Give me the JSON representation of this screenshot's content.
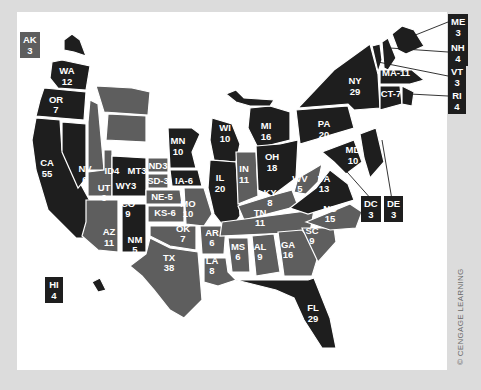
{
  "map": {
    "title": "",
    "legend_colors": {
      "dark": "#1e1e1e",
      "medium": "#5e5e5e",
      "background": "#ffffff",
      "frame": "#dcdcdc"
    },
    "states": {
      "WA": {
        "abbr": "WA",
        "votes": "12",
        "shade": "dark"
      },
      "OR": {
        "abbr": "OR",
        "votes": "7",
        "shade": "dark"
      },
      "CA": {
        "abbr": "CA",
        "votes": "55",
        "shade": "dark"
      },
      "NV": {
        "abbr": "NV",
        "votes": "6",
        "shade": "dark"
      },
      "ID": {
        "abbr": "ID4",
        "votes": "",
        "shade": "medium"
      },
      "MT": {
        "abbr": "MT3",
        "votes": "",
        "shade": "medium"
      },
      "WY": {
        "abbr": "WY3",
        "votes": "",
        "shade": "medium"
      },
      "UT": {
        "abbr": "UT",
        "votes": "6",
        "shade": "medium"
      },
      "CO": {
        "abbr": "CO",
        "votes": "9",
        "shade": "dark"
      },
      "AZ": {
        "abbr": "AZ",
        "votes": "11",
        "shade": "medium"
      },
      "NM": {
        "abbr": "NM",
        "votes": "5",
        "shade": "dark"
      },
      "ND": {
        "abbr": "ND3",
        "votes": "",
        "shade": "medium"
      },
      "SD": {
        "abbr": "SD-3",
        "votes": "",
        "shade": "medium"
      },
      "NE": {
        "abbr": "NE-5",
        "votes": "",
        "shade": "medium"
      },
      "KS": {
        "abbr": "KS-6",
        "votes": "",
        "shade": "medium"
      },
      "OK": {
        "abbr": "OK",
        "votes": "7",
        "shade": "medium"
      },
      "TX": {
        "abbr": "TX",
        "votes": "38",
        "shade": "medium"
      },
      "MN": {
        "abbr": "MN",
        "votes": "10",
        "shade": "dark"
      },
      "IA": {
        "abbr": "IA-6",
        "votes": "",
        "shade": "dark"
      },
      "MO": {
        "abbr": "MO",
        "votes": "10",
        "shade": "medium"
      },
      "AR": {
        "abbr": "AR",
        "votes": "6",
        "shade": "medium"
      },
      "LA": {
        "abbr": "LA",
        "votes": "8",
        "shade": "medium"
      },
      "WI": {
        "abbr": "WI",
        "votes": "10",
        "shade": "dark"
      },
      "IL": {
        "abbr": "IL",
        "votes": "20",
        "shade": "dark"
      },
      "MI": {
        "abbr": "MI",
        "votes": "16",
        "shade": "dark"
      },
      "IN": {
        "abbr": "IN",
        "votes": "11",
        "shade": "medium"
      },
      "OH": {
        "abbr": "OH",
        "votes": "18",
        "shade": "dark"
      },
      "KY": {
        "abbr": "KY",
        "votes": "8",
        "shade": "medium"
      },
      "TN": {
        "abbr": "TN",
        "votes": "11",
        "shade": "medium"
      },
      "MS": {
        "abbr": "MS",
        "votes": "6",
        "shade": "medium"
      },
      "AL": {
        "abbr": "AL",
        "votes": "9",
        "shade": "medium"
      },
      "GA": {
        "abbr": "GA",
        "votes": "16",
        "shade": "medium"
      },
      "FL": {
        "abbr": "FL",
        "votes": "29",
        "shade": "dark"
      },
      "SC": {
        "abbr": "SC",
        "votes": "9",
        "shade": "medium"
      },
      "NC": {
        "abbr": "NC",
        "votes": "15",
        "shade": "medium"
      },
      "VA": {
        "abbr": "VA",
        "votes": "13",
        "shade": "dark"
      },
      "WV": {
        "abbr": "WV",
        "votes": "5",
        "shade": "medium"
      },
      "PA": {
        "abbr": "PA",
        "votes": "20",
        "shade": "dark"
      },
      "NY": {
        "abbr": "NY",
        "votes": "29",
        "shade": "dark"
      },
      "NJ": {
        "abbr": "NJ",
        "votes": "14",
        "shade": "dark"
      },
      "MD": {
        "abbr": "MD",
        "votes": "10",
        "shade": "dark"
      },
      "MA": {
        "abbr": "MA-11",
        "votes": "",
        "shade": "dark"
      },
      "CT": {
        "abbr": "CT-7",
        "votes": "",
        "shade": "dark"
      }
    },
    "callouts": {
      "AK": {
        "abbr": "AK",
        "votes": "3",
        "shade": "medium"
      },
      "HI": {
        "abbr": "HI",
        "votes": "4",
        "shade": "dark"
      },
      "ME": {
        "abbr": "ME",
        "votes": "3",
        "shade": "dark"
      },
      "NH": {
        "abbr": "NH",
        "votes": "4",
        "shade": "dark"
      },
      "VT": {
        "abbr": "VT",
        "votes": "3",
        "shade": "dark"
      },
      "RI": {
        "abbr": "RI",
        "votes": "4",
        "shade": "dark"
      },
      "DC": {
        "abbr": "DC",
        "votes": "3",
        "shade": "dark"
      },
      "DE": {
        "abbr": "DE",
        "votes": "3",
        "shade": "dark"
      }
    },
    "credit": "© CENGAGE LEARNING"
  }
}
